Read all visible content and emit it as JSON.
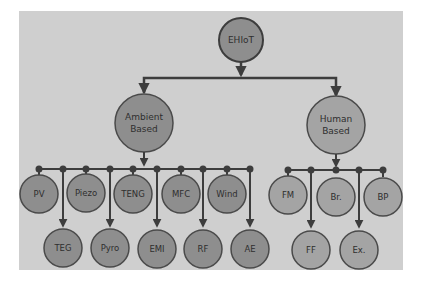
{
  "diagram": {
    "colors": {
      "panel": "#cfcfcf",
      "line": "#3d3d3d",
      "node_dark": "#8e8e8e",
      "node_light": "#a4a4a4",
      "node_border": "#4a4a4a",
      "text": "#2e2e2e"
    },
    "root": {
      "label": "EHIoT"
    },
    "categories": [
      {
        "label_line1": "Ambient",
        "label_line2": "Based",
        "children": [
          {
            "label": "PV",
            "row": 1
          },
          {
            "label": "TEG",
            "row": 2
          },
          {
            "label": "Piezo",
            "row": 1
          },
          {
            "label": "Pyro",
            "row": 2
          },
          {
            "label": "TENG",
            "row": 1
          },
          {
            "label": "EMI",
            "row": 2
          },
          {
            "label": "MFC",
            "row": 1
          },
          {
            "label": "RF",
            "row": 2
          },
          {
            "label": "Wind",
            "row": 1
          },
          {
            "label": "AE",
            "row": 2
          }
        ]
      },
      {
        "label_line1": "Human",
        "label_line2": "Based",
        "children": [
          {
            "label": "FM",
            "row": 1
          },
          {
            "label": "FF",
            "row": 2
          },
          {
            "label": "Br.",
            "row": 1
          },
          {
            "label": "Ex.",
            "row": 2
          },
          {
            "label": "BP",
            "row": 1
          }
        ]
      }
    ]
  }
}
